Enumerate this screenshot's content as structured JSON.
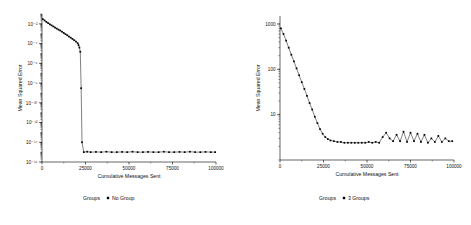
{
  "chart_data": [
    {
      "type": "line",
      "panel": "left",
      "title": "",
      "xlabel": "Cumulative Messages Sent",
      "ylabel": "Mean Squared Error",
      "yscale": "log",
      "xlim": [
        0,
        100000
      ],
      "ylim": [
        1e-16,
        0.1
      ],
      "xticks": [
        0,
        25000,
        50000,
        75000,
        100000
      ],
      "xtick_labels": [
        "0",
        "25000",
        "50000",
        "75000",
        "100000"
      ],
      "yticks": [
        0.01,
        0.0001,
        1e-06,
        1e-08,
        1e-10,
        1e-12,
        1e-14,
        1e-16
      ],
      "ytick_labels": [
        "10⁻²",
        "10⁻⁴",
        "10⁻⁶",
        "10⁻⁸",
        "10⁻¹⁰",
        "10⁻¹²",
        "10⁻¹⁴",
        "10⁻¹⁶"
      ],
      "legend": {
        "title": "Groups",
        "entries": [
          {
            "label": "No Group",
            "marker": "square",
            "color": "#000000"
          }
        ]
      },
      "grid": false,
      "marker": "square",
      "series": [
        {
          "name": "No Group",
          "x": [
            500,
            1500,
            2500,
            3500,
            4500,
            5500,
            6500,
            7500,
            8500,
            9500,
            10500,
            11500,
            12500,
            13500,
            14500,
            15500,
            16500,
            17500,
            18500,
            19500,
            20500,
            21000,
            21500,
            22000,
            22500,
            23000,
            24000,
            26000,
            28000,
            31000,
            34000,
            37000,
            40000,
            43000,
            46000,
            49000,
            52000,
            55000,
            58000,
            61000,
            64000,
            67000,
            70000,
            73000,
            76000,
            79000,
            82000,
            85000,
            88000,
            91000,
            94000,
            97000,
            99500
          ],
          "y": [
            0.03,
            0.022,
            0.016,
            0.012,
            0.009,
            0.007,
            0.0055,
            0.0042,
            0.0033,
            0.0026,
            0.0021,
            0.0016,
            0.0012,
            0.0009,
            0.0007,
            0.00052,
            0.0004,
            0.0003,
            0.00022,
            0.00016,
            0.00011,
            7e-05,
            4e-05,
            1.5e-05,
            3e-09,
            1e-14,
            1e-15,
            1.1e-15,
            1e-15,
            1.05e-15,
            1e-15,
            1.1e-15,
            1e-15,
            1e-15,
            1.05e-15,
            1e-15,
            1.1e-15,
            1e-15,
            1e-15,
            1.05e-15,
            1e-15,
            1e-15,
            1.1e-15,
            1e-15,
            1e-15,
            1.05e-15,
            1e-15,
            1.1e-15,
            1e-15,
            1e-15,
            1.05e-15,
            1e-15,
            1e-15
          ]
        }
      ]
    },
    {
      "type": "line",
      "panel": "right",
      "title": "",
      "xlabel": "Cumulative Messages Sent",
      "ylabel": "Mean Squared Error",
      "yscale": "log",
      "xlim": [
        0,
        100000
      ],
      "ylim": [
        1,
        1500
      ],
      "xticks": [
        0,
        25000,
        50000,
        75000,
        100000
      ],
      "xtick_labels": [
        "0",
        "25000",
        "50000",
        "75000",
        "100000"
      ],
      "yticks": [
        1000,
        100,
        10
      ],
      "ytick_labels": [
        "1000",
        "100",
        "10"
      ],
      "legend": {
        "title": "Groups",
        "entries": [
          {
            "label": "3 Groups",
            "marker": "square",
            "color": "#000000"
          }
        ]
      },
      "grid": false,
      "marker": "square",
      "series": [
        {
          "name": "3 Groups",
          "x": [
            500,
            2000,
            3500,
            5000,
            6500,
            8000,
            9500,
            11000,
            12500,
            14000,
            15500,
            17000,
            18500,
            20000,
            21500,
            23000,
            24500,
            26000,
            27500,
            29000,
            31000,
            33000,
            35000,
            37000,
            39000,
            41000,
            43000,
            45000,
            47000,
            49000,
            51000,
            53000,
            55000,
            57000,
            59000,
            61000,
            63000,
            65000,
            67000,
            69000,
            71000,
            73000,
            75000,
            77000,
            79000,
            81000,
            83000,
            85000,
            87000,
            89000,
            91000,
            93000,
            95000,
            97000,
            99000
          ],
          "y": [
            800,
            600,
            430,
            300,
            210,
            150,
            105,
            74,
            52,
            37,
            26,
            18,
            13,
            9,
            6.5,
            4.8,
            3.8,
            3.2,
            2.9,
            2.7,
            2.6,
            2.5,
            2.5,
            2.4,
            2.4,
            2.4,
            2.4,
            2.4,
            2.4,
            2.4,
            2.5,
            2.4,
            2.5,
            2.4,
            3.2,
            4.0,
            3.0,
            2.6,
            3.6,
            2.6,
            4.2,
            2.5,
            4.0,
            2.6,
            3.8,
            2.5,
            3.6,
            2.4,
            3.0,
            2.5,
            3.4,
            2.5,
            3.0,
            2.6,
            2.6
          ]
        }
      ]
    }
  ]
}
